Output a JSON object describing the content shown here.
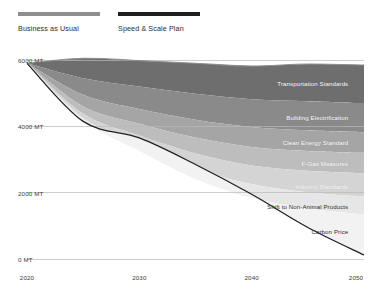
{
  "legend": {
    "items": [
      {
        "label": "Business as Usual",
        "color": "#8e8e8e"
      },
      {
        "label": "Speed & Scale Plan",
        "color": "#1f1f1f"
      }
    ]
  },
  "chart_data": {
    "type": "area",
    "title": "",
    "xlabel": "",
    "ylabel": "",
    "grid": true,
    "legend_position": "top-left",
    "x": [
      2020,
      2025,
      2030,
      2035,
      2040,
      2045,
      2050
    ],
    "xlim": [
      2020,
      2050
    ],
    "ylim": [
      0,
      6000
    ],
    "x_ticks": [
      "2020",
      "2030",
      "2040",
      "2050"
    ],
    "x_tick_values": [
      2020,
      2030,
      2040,
      2050
    ],
    "y_ticks": [
      "0 MT",
      "2000 MT",
      "4000 MT",
      "6000 MT"
    ],
    "y_tick_values": [
      0,
      2000,
      4000,
      6000
    ],
    "units": "MT",
    "baseline_series": {
      "name": "Business as Usual",
      "values": [
        5900,
        6050,
        5980,
        5900,
        5820,
        5880,
        5850
      ],
      "color": "#8e8e8e"
    },
    "plan_series": {
      "name": "Speed & Scale Plan",
      "values": [
        5900,
        4150,
        3650,
        2850,
        1950,
        950,
        120
      ],
      "color": "#1f1f1f"
    },
    "series": [
      {
        "name": "Transportation Standards",
        "color": "#6e6e6e",
        "top_values": [
          5900,
          6050,
          5980,
          5900,
          5820,
          5880,
          5850
        ],
        "bottom_values": [
          5900,
          5450,
          5200,
          4980,
          4820,
          4760,
          4700
        ]
      },
      {
        "name": "Building Electrification",
        "color": "#8a8a8a",
        "top_values": [
          5900,
          5450,
          5200,
          4980,
          4820,
          4760,
          4700
        ],
        "bottom_values": [
          5900,
          4950,
          4520,
          4200,
          3980,
          3880,
          3820
        ]
      },
      {
        "name": "Clean Energy Standard",
        "color": "#a5a5a5",
        "top_values": [
          5900,
          4950,
          4520,
          4200,
          3980,
          3880,
          3820
        ],
        "bottom_values": [
          5900,
          4600,
          4080,
          3660,
          3380,
          3260,
          3200
        ]
      },
      {
        "name": "F-Gas Measures",
        "color": "#bdbdbd",
        "top_values": [
          5900,
          4600,
          4080,
          3660,
          3380,
          3260,
          3200
        ],
        "bottom_values": [
          5900,
          4380,
          3720,
          3180,
          2820,
          2660,
          2580
        ]
      },
      {
        "name": "Industry Standards",
        "color": "#d4d4d4",
        "top_values": [
          5900,
          4380,
          3720,
          3180,
          2820,
          2660,
          2580
        ],
        "bottom_values": [
          5900,
          4250,
          3440,
          2720,
          2260,
          2010,
          1880
        ]
      },
      {
        "name": "Shift to Non-Animal Products",
        "color": "#e6e6e6",
        "top_values": [
          5900,
          4250,
          3440,
          2720,
          2260,
          2010,
          1880
        ],
        "bottom_values": [
          5900,
          4190,
          3270,
          2420,
          1850,
          1520,
          1340
        ]
      },
      {
        "name": "Carbon Price",
        "color": "#f2f2f2",
        "top_values": [
          5900,
          4190,
          3270,
          2420,
          1850,
          1520,
          1340
        ],
        "bottom_values": [
          5900,
          4150,
          3650,
          2850,
          1950,
          950,
          120
        ]
      }
    ],
    "band_labels": [
      {
        "text": "Transportation Standards",
        "x": 2048.6,
        "y": 5300,
        "light": true
      },
      {
        "text": "Building Electrification",
        "x": 2048.6,
        "y": 4280,
        "light": true
      },
      {
        "text": "Clean Energy Standard",
        "x": 2048.6,
        "y": 3520,
        "light": true
      },
      {
        "text": "F-Gas Measures",
        "x": 2048.6,
        "y": 2900,
        "light": true
      },
      {
        "text": "Industry Standards",
        "x": 2048.6,
        "y": 2210,
        "light": true
      },
      {
        "text": "Shift to Non-Animal Products",
        "x": 2048.6,
        "y": 1600,
        "light": false
      },
      {
        "text": "Carbon Price",
        "x": 2048.6,
        "y": 830,
        "light": false
      }
    ]
  }
}
